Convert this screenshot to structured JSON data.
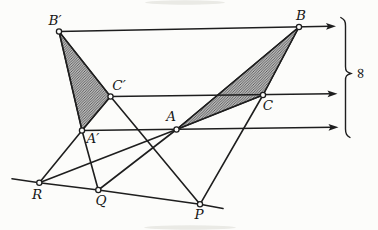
{
  "figure": {
    "width": 378,
    "height": 230,
    "background": "#fcfcfa",
    "ink": "#1e1e1e",
    "hatch": {
      "base": "#dcdcdc",
      "stripe": "#4f4f4f",
      "spacing": 2.6,
      "stripe_width": 0.9
    },
    "points": [
      {
        "id": "B-prime",
        "label": "B′",
        "x": 59,
        "y": 31.5,
        "label_x": 55,
        "label_y": 25
      },
      {
        "id": "B",
        "label": "B",
        "x": 299,
        "y": 27,
        "label_x": 301,
        "label_y": 20
      },
      {
        "id": "C-prime",
        "label": "C′",
        "x": 110.5,
        "y": 96.5,
        "label_x": 119,
        "label_y": 90
      },
      {
        "id": "C",
        "label": "C",
        "x": 263,
        "y": 95,
        "label_x": 268,
        "label_y": 110
      },
      {
        "id": "A-prime",
        "label": "A′",
        "x": 82,
        "y": 130.5,
        "label_x": 93,
        "label_y": 143
      },
      {
        "id": "A",
        "label": "A",
        "x": 176.5,
        "y": 129.5,
        "label_x": 171,
        "label_y": 121
      },
      {
        "id": "R",
        "label": "R",
        "x": 39.3,
        "y": 182.7,
        "label_x": 37,
        "label_y": 199
      },
      {
        "id": "Q",
        "label": "Q",
        "x": 98.3,
        "y": 190,
        "label_x": 101,
        "label_y": 205
      },
      {
        "id": "P",
        "label": "P",
        "x": 200,
        "y": 204.3,
        "label_x": 199,
        "label_y": 219
      }
    ],
    "triangles": [
      {
        "id": "triangle-left-hatched",
        "vertices": [
          "B-prime",
          "C-prime",
          "A-prime"
        ]
      },
      {
        "id": "triangle-right-hatched",
        "vertices": [
          "A",
          "B",
          "C"
        ]
      }
    ],
    "polylines": [
      {
        "id": "side-ApBp-extended",
        "points": [
          "B-prime",
          "A-prime",
          "Q"
        ]
      },
      {
        "id": "side-ApCp-extended",
        "points": [
          "C-prime",
          "A-prime",
          "R"
        ]
      },
      {
        "id": "side-BpCp-extended",
        "points": [
          "B-prime",
          "C-prime",
          "P"
        ]
      },
      {
        "id": "side-AB-extended",
        "points": [
          "B",
          "A",
          "Q"
        ]
      },
      {
        "id": "side-AC-extended",
        "points": [
          "C",
          "A",
          "R"
        ]
      },
      {
        "id": "side-BC-extended",
        "points": [
          "B",
          "C",
          "P"
        ]
      },
      {
        "id": "axis-line-RQP",
        "raw": [
          [
            12,
            178.8
          ],
          [
            39.3,
            182.7
          ],
          [
            98.3,
            190
          ],
          [
            200,
            204.3
          ],
          [
            223,
            208.5
          ]
        ]
      }
    ],
    "rays": [
      {
        "id": "parallel-ray-B",
        "from": "B-prime",
        "tip": [
          336,
          26.2
        ]
      },
      {
        "id": "parallel-ray-C",
        "from": "C-prime",
        "tip": [
          337.5,
          93.8
        ]
      },
      {
        "id": "parallel-ray-A",
        "from": "A-prime",
        "tip": [
          338.5,
          127.2
        ]
      }
    ],
    "brace": {
      "x": 345.5,
      "top": 18,
      "bottom": 137,
      "cusp_y": 73.5,
      "cusp_x": 350.8
    },
    "infinity": {
      "symbol": "∞",
      "x": 360,
      "y": 73.5,
      "rotation": 90
    },
    "artifacts": [
      {
        "x": 185,
        "y": 2.5,
        "rx": 40,
        "ry": 2.2
      },
      {
        "x": 190,
        "y": 227.5,
        "rx": 46,
        "ry": 2.2
      }
    ],
    "artifact_color": "#e5e5e0"
  }
}
